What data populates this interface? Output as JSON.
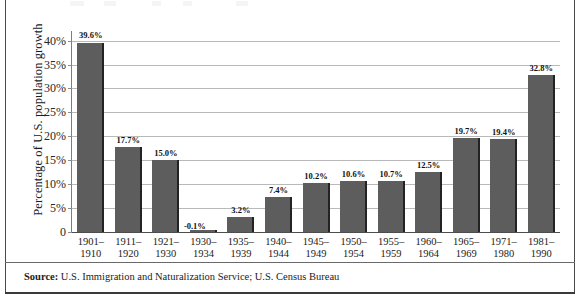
{
  "chart_data": {
    "type": "bar",
    "title": "",
    "xlabel": "",
    "ylabel": "Percentage of U.S. population growth",
    "ylim": [
      0,
      42
    ],
    "grid": true,
    "legend": "none",
    "yticks": [
      "0",
      "5%",
      "10%",
      "15%",
      "20%",
      "25%",
      "30%",
      "35%",
      "40%"
    ],
    "ytick_values": [
      0,
      5,
      10,
      15,
      20,
      25,
      30,
      35,
      40
    ],
    "categories": [
      "1901–\n1910",
      "1911–\n1920",
      "1921–\n1930",
      "1930–\n1934",
      "1935–\n1939",
      "1940–\n1944",
      "1945–\n1949",
      "1950–\n1954",
      "1955–\n1959",
      "1960–\n1964",
      "1965–\n1969",
      "1971–\n1980",
      "1981–\n1990"
    ],
    "values": [
      39.6,
      17.7,
      15.0,
      -0.1,
      3.2,
      7.4,
      10.2,
      10.6,
      10.7,
      12.5,
      19.7,
      19.4,
      32.8
    ],
    "data_labels": [
      "39.6%",
      "17.7%",
      "15.0%",
      "-0.1%",
      "3.2%",
      "7.4%",
      "10.2%",
      "10.6%",
      "10.7%",
      "12.5%",
      "19.7%",
      "19.4%",
      "32.8%"
    ],
    "bar_color": "#5d5d5d",
    "bar_edge_color": "#232323",
    "gridline_color": "#b9b9b9"
  },
  "footer": {
    "source_label": "Source:",
    "source_text": "U.S. Immigration and Naturalization Service; U.S. Census Bureau"
  }
}
